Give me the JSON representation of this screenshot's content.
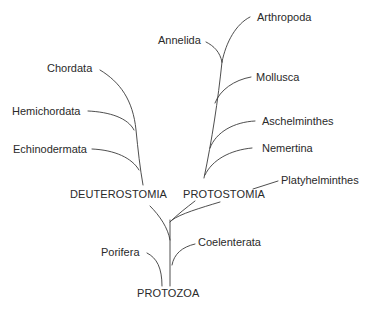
{
  "diagram": {
    "type": "phylogenetic-tree",
    "root": "PROTOZOA",
    "groups": {
      "deuterostomia": "DEUTEROSTOMIA",
      "protostomia": "PROTOSTOMIA"
    },
    "taxa": {
      "arthropoda": "Arthropoda",
      "annelida": "Annelida",
      "mollusca": "Mollusca",
      "aschelminthes": "Aschelminthes",
      "nemertina": "Nemertina",
      "platyhelminthes": "Platyhelminthes",
      "chordata": "Chordata",
      "hemichordata": "Hemichordata",
      "echinodermata": "Echinodermata",
      "coelenterata": "Coelenterata",
      "porifera": "Porifera"
    },
    "line_color": "#3a3a3a",
    "text_color": "#2a2a2a",
    "background": "#ffffff"
  }
}
